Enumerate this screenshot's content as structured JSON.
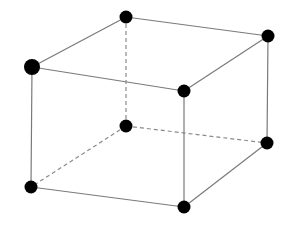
{
  "diagram": {
    "type": "cube-wireframe",
    "colors": {
      "background": "#ffffff",
      "edge": "#7a7a7a",
      "hidden_edge": "#8a8a8a",
      "vertex": "#000000"
    },
    "vertices": [
      {
        "id": "front-top-left",
        "x": 32,
        "y": 67,
        "r": 8,
        "hidden": false
      },
      {
        "id": "back-top-left",
        "x": 126,
        "y": 17,
        "r": 6.5,
        "hidden": false
      },
      {
        "id": "back-top-right",
        "x": 268,
        "y": 36,
        "r": 6.5,
        "hidden": false
      },
      {
        "id": "front-top-right",
        "x": 184,
        "y": 91,
        "r": 6.5,
        "hidden": false
      },
      {
        "id": "back-bottom-left",
        "x": 126,
        "y": 126,
        "r": 6.5,
        "hidden": true
      },
      {
        "id": "back-bottom-right",
        "x": 267,
        "y": 143,
        "r": 6.5,
        "hidden": false
      },
      {
        "id": "front-bottom-left",
        "x": 31,
        "y": 187,
        "r": 6.5,
        "hidden": false
      },
      {
        "id": "front-bottom-right",
        "x": 184,
        "y": 207,
        "r": 6.5,
        "hidden": false
      }
    ],
    "edges": [
      {
        "from": "front-top-left",
        "to": "back-top-left",
        "dashed": false
      },
      {
        "from": "back-top-left",
        "to": "back-top-right",
        "dashed": false
      },
      {
        "from": "back-top-right",
        "to": "front-top-right",
        "dashed": false
      },
      {
        "from": "front-top-right",
        "to": "front-top-left",
        "dashed": false
      },
      {
        "from": "front-top-left",
        "to": "front-bottom-left",
        "dashed": false
      },
      {
        "from": "front-top-right",
        "to": "front-bottom-right",
        "dashed": false
      },
      {
        "from": "back-top-right",
        "to": "back-bottom-right",
        "dashed": false
      },
      {
        "from": "front-bottom-left",
        "to": "front-bottom-right",
        "dashed": false
      },
      {
        "from": "front-bottom-right",
        "to": "back-bottom-right",
        "dashed": false
      },
      {
        "from": "back-top-left",
        "to": "back-bottom-left",
        "dashed": true
      },
      {
        "from": "back-bottom-left",
        "to": "front-bottom-left",
        "dashed": true
      },
      {
        "from": "back-bottom-left",
        "to": "back-bottom-right",
        "dashed": true
      }
    ]
  }
}
